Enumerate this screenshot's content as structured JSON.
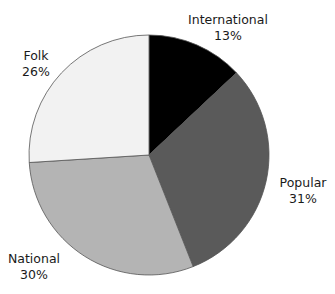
{
  "chart_data": {
    "type": "pie",
    "title": "",
    "title_note": "title cropped at top edge, not legible",
    "start_angle_deg": 0,
    "direction": "clockwise",
    "categories": [
      "International",
      "Popular",
      "National",
      "Folk"
    ],
    "values": [
      13,
      31,
      30,
      26
    ],
    "unit": "%",
    "colors": [
      "#000000",
      "#5a5a5a",
      "#b4b4b4",
      "#f2f2f2"
    ],
    "slice_border_color": "#555555",
    "labels": [
      {
        "name": "International",
        "value_text": "13%",
        "x": 228,
        "y": 12
      },
      {
        "name": "Popular",
        "value_text": "31%",
        "x": 303,
        "y": 175
      },
      {
        "name": "National",
        "value_text": "30%",
        "x": 34,
        "y": 251
      },
      {
        "name": "Folk",
        "value_text": "26%",
        "x": 36,
        "y": 48
      }
    ],
    "legend": null
  },
  "geometry": {
    "cx": 149,
    "cy": 155,
    "r": 120
  }
}
